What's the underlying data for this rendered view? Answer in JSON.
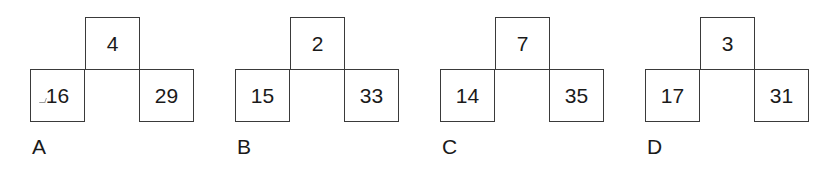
{
  "options": [
    {
      "label": "A",
      "top": "4",
      "left": "16",
      "right": "29"
    },
    {
      "label": "B",
      "top": "2",
      "left": "15",
      "right": "33"
    },
    {
      "label": "C",
      "top": "7",
      "left": "14",
      "right": "35"
    },
    {
      "label": "D",
      "top": "3",
      "left": "17",
      "right": "31"
    }
  ],
  "colors": {
    "border": "#3a3a3a",
    "text": "#1a1a1a",
    "background": "#ffffff"
  }
}
